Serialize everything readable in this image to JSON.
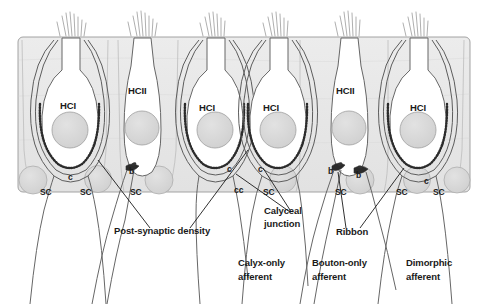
{
  "figure": {
    "background_color": "#ffffff",
    "epithelium_fill": "#e9e9e9",
    "cell_fill": "#ffffff",
    "nucleus_fill": "#d8d8d8",
    "outline_color": "#555555",
    "text_color": "#1a1a1a"
  },
  "hair_cells": [
    {
      "id": "hc1",
      "label": "HCI",
      "type": "type-I",
      "x": 60,
      "y": 106
    },
    {
      "id": "hc2",
      "label": "HCII",
      "type": "type-II",
      "x": 140,
      "y": 92
    },
    {
      "id": "hc3",
      "label": "HCI",
      "type": "type-I",
      "x": 205,
      "y": 108
    },
    {
      "id": "hc4",
      "label": "HCI",
      "type": "type-I",
      "x": 268,
      "y": 108
    },
    {
      "id": "hc5",
      "label": "HCII",
      "type": "type-II",
      "x": 347,
      "y": 92
    },
    {
      "id": "hc6",
      "label": "HCI",
      "type": "type-I",
      "x": 416,
      "y": 108
    }
  ],
  "supporting_cells": [
    {
      "label": "SC",
      "x": 46,
      "y": 192
    },
    {
      "label": "SC",
      "x": 86,
      "y": 192
    },
    {
      "label": "SC",
      "x": 135,
      "y": 192
    },
    {
      "label": "SC",
      "x": 268,
      "y": 192
    },
    {
      "label": "SC",
      "x": 340,
      "y": 192
    },
    {
      "label": "SC",
      "x": 400,
      "y": 192
    },
    {
      "label": "SC",
      "x": 437,
      "y": 192
    }
  ],
  "markers": [
    {
      "label": "c",
      "meaning": "calyx",
      "x": 69,
      "y": 178
    },
    {
      "label": "b",
      "meaning": "bouton",
      "x": 131,
      "y": 172
    },
    {
      "label": "c",
      "meaning": "calyx",
      "x": 228,
      "y": 170
    },
    {
      "label": "cc",
      "meaning": "complex-calyx",
      "x": 238,
      "y": 190
    },
    {
      "label": "c",
      "meaning": "calyx",
      "x": 259,
      "y": 170
    },
    {
      "label": "b",
      "meaning": "bouton",
      "x": 330,
      "y": 172
    },
    {
      "label": "b",
      "meaning": "bouton",
      "x": 358,
      "y": 176
    },
    {
      "label": "c",
      "meaning": "calyx",
      "x": 425,
      "y": 182
    }
  ],
  "callouts": [
    {
      "id": "post-synaptic-density",
      "lines": [
        "Post-synaptic density"
      ],
      "x": 114,
      "y": 231
    },
    {
      "id": "calyceal-junction",
      "lines": [
        "Calyceal",
        "junction"
      ],
      "x": 264,
      "y": 212
    },
    {
      "id": "ribbon",
      "lines": [
        "Ribbon"
      ],
      "x": 336,
      "y": 232
    }
  ],
  "afferent_types": [
    {
      "id": "calyx-only",
      "lines": [
        "Calyx-only",
        "afferent"
      ],
      "x": 238,
      "y": 263
    },
    {
      "id": "bouton-only",
      "lines": [
        "Bouton-only",
        "afferent"
      ],
      "x": 312,
      "y": 263
    },
    {
      "id": "dimorphic",
      "lines": [
        "Dimorphic",
        "afferent"
      ],
      "x": 408,
      "y": 263
    }
  ]
}
